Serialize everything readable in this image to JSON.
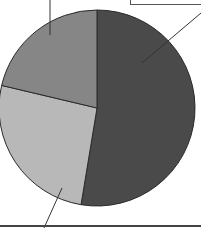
{
  "chart_data": {
    "type": "pie",
    "title": "",
    "start_angle_deg": 0,
    "direction": "clockwise",
    "slices": [
      {
        "label": "",
        "value": 52.6,
        "color": "#4a4a4a"
      },
      {
        "label": "",
        "value": 26.1,
        "color": "#b8b8b8"
      },
      {
        "label": "",
        "value": 21.3,
        "color": "#868686"
      }
    ],
    "categories": [
      "",
      "",
      ""
    ],
    "values": [
      52.6,
      26.1,
      21.3
    ],
    "legend": "none",
    "annotations": "leader lines to labels cropped outside view; labels not legible",
    "center": [
      97,
      108
    ],
    "radius": 98
  },
  "labels": {
    "top_right_box_text": ""
  }
}
